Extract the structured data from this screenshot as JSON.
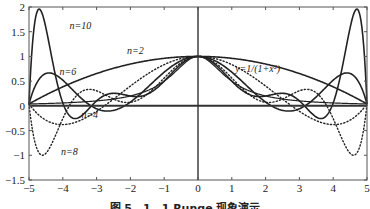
{
  "chart_data": {
    "type": "line",
    "title": "",
    "xlabel": "",
    "ylabel": "",
    "xlim": [
      -5,
      5
    ],
    "ylim": [
      -1.5,
      2
    ],
    "grid": false,
    "xticks": [
      "-5",
      "-4",
      "-3",
      "-2",
      "-1",
      "0",
      "1",
      "2",
      "3",
      "4",
      "5"
    ],
    "yticks": [
      "-1.5",
      "-1",
      "-0.5",
      "0",
      "0.5",
      "1",
      "1.5",
      "2"
    ],
    "function_label": "y=1/(1+x²)",
    "series": [
      {
        "name": "y=1/(1+x²)",
        "style": "solid",
        "width": 1.2,
        "nodes": 0,
        "x": [
          -5,
          -4,
          -3,
          -2,
          -1,
          0,
          1,
          2,
          3,
          4,
          5
        ],
        "values": [
          0.038,
          0.059,
          0.1,
          0.2,
          0.5,
          1,
          0.5,
          0.2,
          0.1,
          0.059,
          0.038
        ]
      },
      {
        "name": "n=2",
        "style": "solid",
        "width": 1.6,
        "nodes": 2,
        "x": [
          -5,
          -4,
          -3,
          -2,
          -1,
          0,
          1,
          2,
          3,
          4,
          5
        ],
        "values": [
          0.038,
          0.35,
          0.63,
          0.83,
          0.96,
          1,
          0.96,
          0.83,
          0.63,
          0.35,
          0.038
        ]
      },
      {
        "name": "n=4",
        "style": "dotted",
        "width": 1.4,
        "nodes": 4,
        "x": [
          -5,
          -4,
          -3,
          -2,
          -1,
          0,
          1,
          2,
          3,
          4,
          5
        ],
        "values": [
          0.038,
          -0.38,
          -0.2,
          0.2,
          0.68,
          1,
          0.68,
          0.2,
          -0.2,
          -0.38,
          0.038
        ]
      },
      {
        "name": "n=6",
        "style": "solid",
        "width": 1.6,
        "nodes": 6,
        "x": [
          -5,
          -4,
          -3,
          -2,
          -1,
          0,
          1,
          2,
          3,
          4,
          5
        ],
        "values": [
          0.038,
          0.62,
          0.1,
          0.1,
          0.58,
          1,
          0.58,
          0.1,
          0.1,
          0.62,
          0.038
        ]
      },
      {
        "name": "n=8",
        "style": "dotted",
        "width": 1.4,
        "nodes": 8,
        "x": [
          -5,
          -4,
          -3,
          -2,
          -1,
          0,
          1,
          2,
          3,
          4,
          5
        ],
        "values": [
          0.038,
          -0.22,
          0.1,
          0.2,
          0.5,
          1,
          0.5,
          0.2,
          0.1,
          -0.22,
          0.038
        ]
      },
      {
        "name": "n=10",
        "style": "solid",
        "width": 1.6,
        "nodes": 10,
        "x": [
          -5,
          -4,
          -3,
          -2,
          -1,
          0,
          1,
          2,
          3,
          4,
          5
        ],
        "values": [
          0.038,
          0.059,
          0.1,
          0.2,
          0.5,
          1,
          0.5,
          0.2,
          0.1,
          0.059,
          0.038
        ]
      }
    ],
    "annotations": [
      {
        "text": "n=10",
        "x": -3.8,
        "y": 1.55
      },
      {
        "text": "n=6",
        "x": -4.1,
        "y": 0.62
      },
      {
        "text": "n=2",
        "x": -2.1,
        "y": 1.05
      },
      {
        "text": "n=4",
        "x": -3.45,
        "y": -0.24
      },
      {
        "text": "n=8",
        "x": -4.05,
        "y": -1.0
      },
      {
        "text": "y=1/(1+x²)",
        "x": 1.1,
        "y": 0.68
      }
    ],
    "caption": "图 5．1．1 Runge 现象演示"
  }
}
